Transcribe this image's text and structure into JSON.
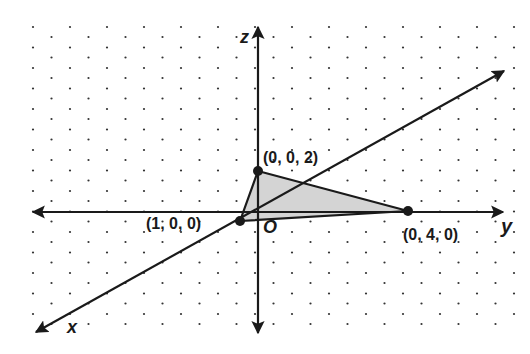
{
  "diagram": {
    "type": "3d-coordinate-system",
    "background": "isometric dot grid",
    "axes": {
      "x": {
        "label": "x"
      },
      "y": {
        "label": "y"
      },
      "z": {
        "label": "z"
      },
      "origin": {
        "label": "O"
      }
    },
    "points": [
      {
        "id": "p-z",
        "label": "(0, 0, 2)"
      },
      {
        "id": "p-x",
        "label": "(1, 0, 0)"
      },
      {
        "id": "p-y",
        "label": "(0, 4, 0)"
      }
    ],
    "shaded_region": "triangle with vertices (1,0,0), (0,4,0), (0,0,2)",
    "colors": {
      "line": "#1a1a1a",
      "shade": "#d4d4d4",
      "dot": "#333333"
    }
  }
}
